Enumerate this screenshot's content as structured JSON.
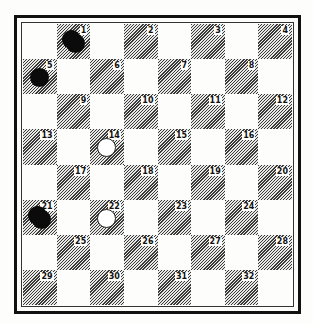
{
  "diagram": {
    "type": "checkers-board",
    "rows": 8,
    "cols": 8,
    "colors": {
      "dark_square": "#3a3a3a",
      "light_square": "#fdfdfb",
      "black_piece": "#0b0b0b",
      "white_piece": "#ffffff"
    },
    "square_numbers": [
      "1",
      "2",
      "3",
      "4",
      "5",
      "6",
      "7",
      "8",
      "9",
      "10",
      "11",
      "12",
      "13",
      "14",
      "15",
      "16",
      "17",
      "18",
      "19",
      "20",
      "21",
      "22",
      "23",
      "24",
      "25",
      "26",
      "27",
      "28",
      "29",
      "30",
      "31",
      "32"
    ],
    "pieces": [
      {
        "square": 1,
        "color": "black",
        "kind": "king"
      },
      {
        "square": 5,
        "color": "black",
        "kind": "man"
      },
      {
        "square": 14,
        "color": "white",
        "kind": "man"
      },
      {
        "square": 21,
        "color": "black",
        "kind": "king"
      },
      {
        "square": 22,
        "color": "white",
        "kind": "man"
      }
    ]
  }
}
